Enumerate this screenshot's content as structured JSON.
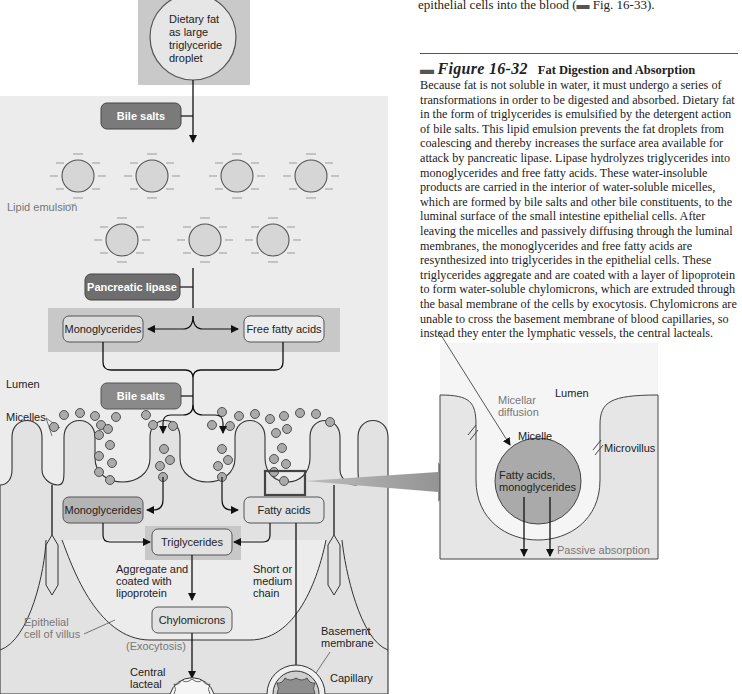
{
  "text_panel": {
    "previous_line": "epithelial cells into the blood (",
    "previous_line_ref": "Fig. 16-33).",
    "figure": {
      "number": "Figure 16-32",
      "title": "Fat Digestion and Absorption",
      "caption": "Because fat is not soluble in water, it must undergo a series of transformations in order to be digested and absorbed. Dietary fat in the form of triglycerides is emulsified by the detergent action of bile salts. This lipid emulsion prevents the fat droplets from coalescing and thereby increases the surface area available for attack by pancreatic lipase. Lipase hydrolyzes triglycerides into monoglycerides and free fatty acids. These water-insoluble products are carried in the interior of water-soluble micelles, which are formed by bile salts and other bile constituents, to the luminal surface of the small intestine epithelial cells. After leaving the micelles and passively diffusing through the luminal membranes, the monoglycerides and free fatty acids are resynthesized into triglycerides in the epithelial cells. These triglycerides aggregate and are coated with a layer of lipoprotein to form water-soluble chylomicrons, which are extruded through the basal membrane of the cells by exocytosis. Chylomicrons are unable to cross the basement membrane of blood capillaries, so instead they enter the lymphatic vessels, the central lacteals."
    }
  },
  "diagram": {
    "dietary_fat": [
      "Dietary fat",
      "as large",
      "triglyceride",
      "droplet"
    ],
    "bile_salts_1": "Bile salts",
    "lipid_emulsion": "Lipid emulsion",
    "pancreatic_lipase": "Pancreatic lipase",
    "monoglycerides_1": "Monoglycerides",
    "free_fatty_acids": "Free fatty acids",
    "lumen": "Lumen",
    "bile_salts_2": "Bile salts",
    "micelles": "Micelles",
    "monoglycerides_2": "Monoglycerides",
    "fatty_acids": "Fatty acids",
    "triglycerides": "Triglycerides",
    "aggregate": [
      "Aggregate and",
      "coated with",
      "lipoprotein"
    ],
    "short_chain": [
      "Short or",
      "medium",
      "chain"
    ],
    "chylomicrons": "Chylomicrons",
    "epithelial_cell": [
      "Epithelial",
      "cell of villus"
    ],
    "exocytosis": "(Exocytosis)",
    "basement_membrane": [
      "Basement",
      "membrane"
    ],
    "central_lacteal": [
      "Central",
      "lacteal"
    ],
    "capillary": "Capillary"
  },
  "inset": {
    "lumen": "Lumen",
    "micellar_diffusion": [
      "Micellar",
      "diffusion"
    ],
    "micelle": "Micelle",
    "microvillus": "Microvillus",
    "contents": [
      "Fatty acids,",
      "monoglycerides"
    ],
    "passive_absorption": "Passive absorption"
  },
  "colors": {
    "panel_bg": "#ececec",
    "dark_box": "#7a7a7a",
    "mid_box": "#b4b4b4",
    "light_box": "#e2e2e2",
    "band": "#c8c8c8",
    "droplet": "#d6d6d6",
    "micelle_dot": "#aaaaaa",
    "capillary_fill": "#8e8e8e"
  }
}
